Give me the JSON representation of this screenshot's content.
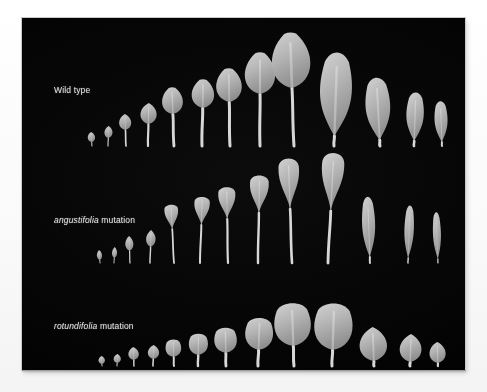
{
  "figure": {
    "background_color": "#fdfdfd",
    "panel_color": "#050505",
    "leaf_color": "#b9b9b9",
    "label_color": "#e8e8e8",
    "panel": {
      "x": 22,
      "y": 18,
      "width": 443,
      "height": 352
    }
  },
  "rows": [
    {
      "id": "wild-type",
      "label_prefix": "",
      "label_italic": "",
      "label_plain": "Wild type",
      "label_x": 32,
      "label_y": 67,
      "baseline_y": 128,
      "note": "rounded ovate rosette leaves with slender petioles, then three pointed cauline leaves",
      "leaves": [
        {
          "cx": 70,
          "blade_w": 9,
          "blade_h": 10,
          "petiole": 4,
          "shape": "round",
          "tilt": -4
        },
        {
          "cx": 86,
          "blade_w": 10,
          "blade_h": 12,
          "petiole": 8,
          "shape": "round",
          "tilt": 2
        },
        {
          "cx": 104,
          "blade_w": 15,
          "blade_h": 16,
          "petiole": 16,
          "shape": "round",
          "tilt": -2
        },
        {
          "cx": 126,
          "blade_w": 20,
          "blade_h": 21,
          "petiole": 22,
          "shape": "round",
          "tilt": 1
        },
        {
          "cx": 152,
          "blade_w": 26,
          "blade_h": 27,
          "petiole": 32,
          "shape": "ovate",
          "tilt": -2
        },
        {
          "cx": 180,
          "blade_w": 28,
          "blade_h": 29,
          "petiole": 38,
          "shape": "ovate",
          "tilt": 1
        },
        {
          "cx": 208,
          "blade_w": 32,
          "blade_h": 34,
          "petiole": 44,
          "shape": "ovate",
          "tilt": -1
        },
        {
          "cx": 238,
          "blade_w": 38,
          "blade_h": 42,
          "petiole": 52,
          "shape": "ovate",
          "tilt": 0
        },
        {
          "cx": 272,
          "blade_w": 48,
          "blade_h": 56,
          "petiole": 58,
          "shape": "ovate",
          "tilt": -2
        },
        {
          "cx": 312,
          "blade_w": 44,
          "blade_h": 86,
          "petiole": 10,
          "shape": "lance",
          "tilt": 2
        },
        {
          "cx": 358,
          "blade_w": 34,
          "blade_h": 64,
          "petiole": 6,
          "shape": "lance",
          "tilt": -3
        },
        {
          "cx": 392,
          "blade_w": 24,
          "blade_h": 50,
          "petiole": 5,
          "shape": "lance",
          "tilt": 2
        },
        {
          "cx": 420,
          "blade_w": 18,
          "blade_h": 42,
          "petiole": 4,
          "shape": "lance",
          "tilt": -2
        }
      ]
    },
    {
      "id": "angustifolia",
      "label_prefix": "",
      "label_italic": "angustifolia",
      "label_plain": " mutation",
      "label_x": 32,
      "label_y": 197,
      "baseline_y": 245,
      "note": "narrow spatulate blades on long slender petioles",
      "leaves": [
        {
          "cx": 78,
          "blade_w": 7,
          "blade_h": 10,
          "petiole": 3,
          "shape": "narrow",
          "tilt": -4
        },
        {
          "cx": 92,
          "blade_w": 7,
          "blade_h": 11,
          "petiole": 5,
          "shape": "narrow",
          "tilt": 3
        },
        {
          "cx": 108,
          "blade_w": 11,
          "blade_h": 15,
          "petiole": 12,
          "shape": "narrow",
          "tilt": -2
        },
        {
          "cx": 128,
          "blade_w": 13,
          "blade_h": 17,
          "petiole": 16,
          "shape": "narrow",
          "tilt": 2
        },
        {
          "cx": 152,
          "blade_w": 16,
          "blade_h": 26,
          "petiole": 34,
          "shape": "spatula",
          "tilt": -3
        },
        {
          "cx": 178,
          "blade_w": 18,
          "blade_h": 30,
          "petiole": 38,
          "shape": "spatula",
          "tilt": 2
        },
        {
          "cx": 206,
          "blade_w": 20,
          "blade_h": 34,
          "petiole": 44,
          "shape": "spatula",
          "tilt": -1
        },
        {
          "cx": 236,
          "blade_w": 22,
          "blade_h": 40,
          "petiole": 50,
          "shape": "spatula",
          "tilt": 1
        },
        {
          "cx": 270,
          "blade_w": 24,
          "blade_h": 54,
          "petiole": 54,
          "shape": "spatula",
          "tilt": -2
        },
        {
          "cx": 306,
          "blade_w": 26,
          "blade_h": 62,
          "petiole": 52,
          "shape": "spatula",
          "tilt": 3
        },
        {
          "cx": 348,
          "blade_w": 18,
          "blade_h": 62,
          "petiole": 6,
          "shape": "lance",
          "tilt": -2
        },
        {
          "cx": 386,
          "blade_w": 13,
          "blade_h": 54,
          "petiole": 5,
          "shape": "lance",
          "tilt": 2
        },
        {
          "cx": 416,
          "blade_w": 11,
          "blade_h": 48,
          "petiole": 4,
          "shape": "lance",
          "tilt": -2
        }
      ]
    },
    {
      "id": "rotundifolia",
      "label_prefix": "",
      "label_italic": "rotundifolia",
      "label_plain": " mutation",
      "label_x": 32,
      "label_y": 303,
      "baseline_y": 348,
      "note": "short rounded / broadly triangular blades on very short petioles",
      "leaves": [
        {
          "cx": 80,
          "blade_w": 8,
          "blade_h": 8,
          "petiole": 2,
          "shape": "round",
          "tilt": -3
        },
        {
          "cx": 95,
          "blade_w": 9,
          "blade_h": 9,
          "petiole": 3,
          "shape": "round",
          "tilt": 2
        },
        {
          "cx": 112,
          "blade_w": 13,
          "blade_h": 13,
          "petiole": 6,
          "shape": "round",
          "tilt": -2
        },
        {
          "cx": 131,
          "blade_w": 14,
          "blade_h": 14,
          "petiole": 7,
          "shape": "round",
          "tilt": 2
        },
        {
          "cx": 152,
          "blade_w": 18,
          "blade_h": 18,
          "petiole": 9,
          "shape": "deltoid",
          "tilt": -2
        },
        {
          "cx": 176,
          "blade_w": 22,
          "blade_h": 22,
          "petiole": 11,
          "shape": "deltoid",
          "tilt": 1
        },
        {
          "cx": 204,
          "blade_w": 26,
          "blade_h": 26,
          "petiole": 13,
          "shape": "deltoid",
          "tilt": -1
        },
        {
          "cx": 236,
          "blade_w": 32,
          "blade_h": 33,
          "petiole": 16,
          "shape": "deltoid",
          "tilt": 2
        },
        {
          "cx": 272,
          "blade_w": 42,
          "blade_h": 44,
          "petiole": 20,
          "shape": "deltoid",
          "tilt": -2
        },
        {
          "cx": 310,
          "blade_w": 44,
          "blade_h": 48,
          "petiole": 16,
          "shape": "deltoid",
          "tilt": 2
        },
        {
          "cx": 352,
          "blade_w": 34,
          "blade_h": 34,
          "petiole": 5,
          "shape": "round",
          "tilt": -2
        },
        {
          "cx": 388,
          "blade_w": 27,
          "blade_h": 28,
          "petiole": 4,
          "shape": "round",
          "tilt": 2
        },
        {
          "cx": 416,
          "blade_w": 20,
          "blade_h": 21,
          "petiole": 3,
          "shape": "round",
          "tilt": -2
        }
      ]
    }
  ]
}
